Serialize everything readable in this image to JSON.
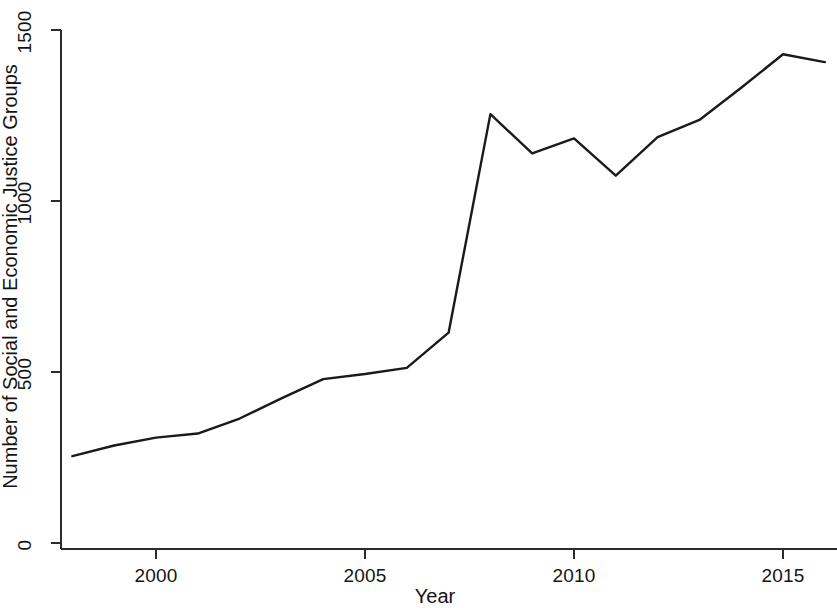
{
  "chart_data": {
    "type": "line",
    "title": "",
    "subtitle": "",
    "xlabel": "Year",
    "ylabel": "Number of Social and Economic Justice Groups",
    "x": [
      1998,
      1999,
      2000,
      2001,
      2002,
      2003,
      2004,
      2005,
      2006,
      2007,
      2008,
      2009,
      2010,
      2011,
      2012,
      2013,
      2014,
      2015,
      2016
    ],
    "values": [
      254,
      285,
      308,
      320,
      364,
      423,
      479,
      494,
      512,
      615,
      1254,
      1139,
      1183,
      1074,
      1187,
      1237,
      1331,
      1429,
      1406
    ],
    "series": [
      {
        "name": "Number of Social and Economic Justice Groups",
        "values": [
          254,
          285,
          308,
          320,
          364,
          423,
          479,
          494,
          512,
          615,
          1254,
          1139,
          1183,
          1074,
          1187,
          1237,
          1331,
          1429,
          1406
        ]
      }
    ],
    "xlim": [
      1998,
      2016.6
    ],
    "ylim": [
      0,
      1560
    ],
    "xticks": [
      2000,
      2005,
      2010,
      2015
    ],
    "xtick_labels": [
      "2000",
      "2005",
      "2010",
      "2015"
    ],
    "yticks": [
      0,
      500,
      1000,
      1500
    ],
    "ytick_labels": [
      "0",
      "500",
      "1000",
      "1500"
    ],
    "grid": false,
    "legend": false,
    "legend_position": "none",
    "line_color": "#1a1a1a",
    "line_width": 2,
    "background_color": "#ffffff",
    "axis_color": "#2b2b2b"
  },
  "axes": {
    "y_title": "Number of Social and Economic Justice Groups",
    "x_title": "Year",
    "y_ticks": [
      {
        "label": "1500",
        "value": 1500
      },
      {
        "label": "1000",
        "value": 1000
      },
      {
        "label": "500",
        "value": 500
      },
      {
        "label": "0",
        "value": 0
      }
    ],
    "x_ticks": [
      {
        "label": "2000",
        "value": 2000
      },
      {
        "label": "2005",
        "value": 2005
      },
      {
        "label": "2010",
        "value": 2010
      },
      {
        "label": "2015",
        "value": 2015
      }
    ]
  }
}
